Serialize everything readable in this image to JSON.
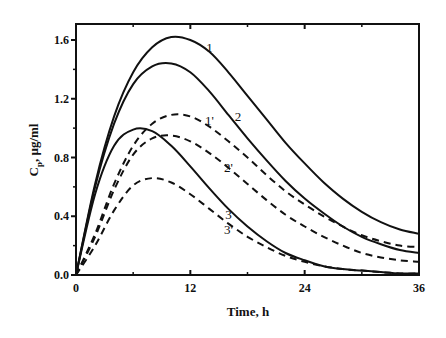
{
  "chart_data": {
    "type": "line",
    "title": "",
    "xlabel": "Time, h",
    "ylabel": "Cp, µg/ml",
    "ylabel_main": "C",
    "ylabel_sub": "p",
    "ylabel_rest": ", µg/ml",
    "xlim": [
      0,
      36
    ],
    "ylim": [
      0,
      1.7
    ],
    "xticks": [
      0,
      12,
      24,
      36
    ],
    "xtick_labels": [
      "0",
      "12",
      "24",
      "36"
    ],
    "yticks": [
      0.0,
      0.4,
      0.8,
      1.2,
      1.6
    ],
    "ytick_labels": [
      "0.0",
      "0.4",
      "0.8",
      "1.2",
      "1.6"
    ],
    "grid": false,
    "legend": "inline curve labels",
    "x": [
      0,
      2,
      4,
      6,
      8,
      10,
      12,
      14,
      16,
      18,
      20,
      22,
      24,
      26,
      28,
      30,
      32,
      34,
      36
    ],
    "series": [
      {
        "name": "1",
        "style": "solid",
        "label_pos": [
          14.0,
          1.52
        ],
        "values": [
          0,
          0.62,
          1.08,
          1.38,
          1.55,
          1.62,
          1.6,
          1.52,
          1.38,
          1.22,
          1.06,
          0.9,
          0.76,
          0.63,
          0.52,
          0.43,
          0.36,
          0.31,
          0.28
        ]
      },
      {
        "name": "2",
        "style": "solid",
        "label_pos": [
          17.0,
          1.05
        ],
        "values": [
          0,
          0.6,
          1.03,
          1.3,
          1.42,
          1.44,
          1.38,
          1.25,
          1.09,
          0.93,
          0.78,
          0.64,
          0.52,
          0.42,
          0.33,
          0.26,
          0.21,
          0.17,
          0.15
        ]
      },
      {
        "name": "3",
        "style": "solid",
        "label_pos": [
          16.0,
          0.38
        ],
        "values": [
          0,
          0.55,
          0.88,
          0.99,
          0.98,
          0.88,
          0.74,
          0.59,
          0.45,
          0.33,
          0.23,
          0.15,
          0.1,
          0.06,
          0.04,
          0.03,
          0.02,
          0.01,
          0.01
        ]
      },
      {
        "name": "1'",
        "style": "dashed",
        "label_pos": [
          14.0,
          1.02
        ],
        "values": [
          0,
          0.28,
          0.62,
          0.88,
          1.03,
          1.09,
          1.08,
          1.01,
          0.91,
          0.8,
          0.68,
          0.57,
          0.48,
          0.4,
          0.33,
          0.27,
          0.23,
          0.2,
          0.19
        ]
      },
      {
        "name": "2'",
        "style": "dashed",
        "label_pos": [
          16.0,
          0.7
        ],
        "values": [
          0,
          0.26,
          0.58,
          0.82,
          0.93,
          0.95,
          0.91,
          0.83,
          0.73,
          0.62,
          0.51,
          0.41,
          0.33,
          0.26,
          0.2,
          0.15,
          0.12,
          0.1,
          0.09
        ]
      },
      {
        "name": "3'",
        "style": "dashed",
        "label_pos": [
          16.0,
          0.28
        ],
        "values": [
          0,
          0.2,
          0.44,
          0.61,
          0.66,
          0.63,
          0.55,
          0.45,
          0.35,
          0.26,
          0.19,
          0.13,
          0.09,
          0.06,
          0.04,
          0.03,
          0.02,
          0.01,
          0.01
        ]
      }
    ]
  }
}
